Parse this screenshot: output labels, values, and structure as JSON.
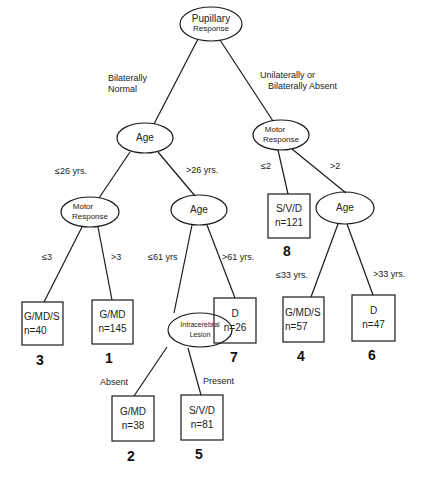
{
  "diagram": {
    "type": "decision-tree",
    "root": {
      "label_line1": "Pupillary",
      "label_line2": "Response"
    },
    "edges": {
      "root_left": "Bilaterally\nNormal",
      "root_left_line1": "Bilaterally",
      "root_left_line2": "Normal",
      "root_right_line1": "Unilaterally  or",
      "root_right_line2": "Bilaterally Absent",
      "age1_left": "≤26  yrs.",
      "age1_right": ">26  yrs.",
      "motor_left_left": "≤3",
      "motor_left_right": ">3",
      "age2_left": "≤61  yrs",
      "age2_right": ">61  yrs.",
      "lesion_left": "Absent",
      "lesion_right": "Present",
      "motor_right_left": "≤2",
      "motor_right_right": ">2",
      "age3_left": "≤33  yrs.",
      "age3_right": ">33  yrs."
    },
    "nodes": {
      "age1": "Age",
      "motor_left_line1": "Motor",
      "motor_left_line2": "Response",
      "age2": "Age",
      "lesion_line1": "Intracerebral",
      "lesion_line2": "Lesion",
      "motor_right_line1": "Motor",
      "motor_right_line2": "Response",
      "age3": "Age"
    },
    "leaves": [
      {
        "id": "3",
        "outcome": "G/MD/S",
        "n": "n=40"
      },
      {
        "id": "1",
        "outcome": "G/MD",
        "n": "n=145"
      },
      {
        "id": "2",
        "outcome": "G/MD",
        "n": "n=38"
      },
      {
        "id": "5",
        "outcome": "S/V/D",
        "n": "n=81"
      },
      {
        "id": "7",
        "outcome": "D",
        "n": "n=26"
      },
      {
        "id": "8",
        "outcome": "S/V/D",
        "n": "n=121"
      },
      {
        "id": "4",
        "outcome": "G/MD/S",
        "n": "n=57"
      },
      {
        "id": "6",
        "outcome": "D",
        "n": "n=47"
      }
    ],
    "colors": {
      "line": "#1a1a1a",
      "background": "#ffffff"
    }
  }
}
